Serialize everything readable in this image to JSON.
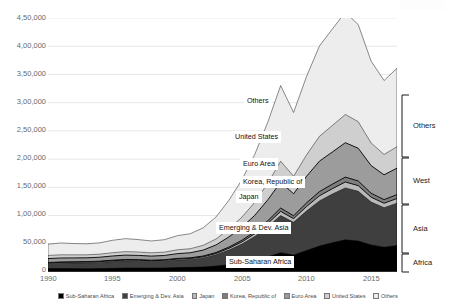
{
  "chart_data": {
    "type": "area",
    "stacked": true,
    "title": "",
    "subtitle": "",
    "xlabel": "",
    "ylabel": "",
    "xlim": [
      1990,
      2017
    ],
    "ylim": [
      0,
      450000
    ],
    "grid": true,
    "grid_axis": "y",
    "legend_position": "bottom",
    "number_format": "indian-grouping",
    "x": [
      1990,
      1991,
      1992,
      1993,
      1994,
      1995,
      1996,
      1997,
      1998,
      1999,
      2000,
      2001,
      2002,
      2003,
      2004,
      2005,
      2006,
      2007,
      2008,
      2009,
      2010,
      2011,
      2012,
      2013,
      2014,
      2015,
      2016,
      2017
    ],
    "xticks": [
      1990,
      1995,
      2000,
      2005,
      2010,
      2015
    ],
    "xtick_labels": [
      "1990",
      "1995",
      "2000",
      "2005",
      "2010",
      "2015"
    ],
    "yticks": [
      0,
      50000,
      100000,
      150000,
      200000,
      250000,
      300000,
      350000,
      400000,
      450000
    ],
    "ytick_labels": [
      "0",
      "50,000",
      "1,00,000",
      "1,50,000",
      "2,00,000",
      "2,50,000",
      "3,00,000",
      "3,50,000",
      "4,00,000",
      "4,50,000"
    ],
    "series": [
      {
        "name": "Sub-Saharan Africa",
        "color": "#000000",
        "values": [
          6000,
          6200,
          6000,
          5800,
          6000,
          6500,
          7000,
          7200,
          7000,
          7200,
          7800,
          8200,
          9000,
          10500,
          13000,
          16500,
          21000,
          27000,
          34000,
          30000,
          38000,
          46000,
          52000,
          57000,
          55000,
          48000,
          44000,
          47000
        ]
      },
      {
        "name": "Emerging & Dev. Asia",
        "color": "#3f3f3f",
        "values": [
          9000,
          9500,
          10000,
          10500,
          11000,
          12000,
          12500,
          12000,
          11500,
          12000,
          13500,
          14000,
          16000,
          20000,
          26000,
          33000,
          42000,
          53000,
          66000,
          58000,
          70000,
          80000,
          86000,
          92000,
          88000,
          76000,
          70000,
          75000
        ]
      },
      {
        "name": "Japan",
        "color": "#b9b9b9",
        "values": [
          1200,
          1300,
          1300,
          1300,
          1400,
          1500,
          1600,
          1600,
          1500,
          1500,
          1600,
          1700,
          1900,
          2300,
          3000,
          3800,
          4800,
          6000,
          7400,
          6500,
          8000,
          9000,
          9600,
          10500,
          10000,
          8500,
          7800,
          8200
        ]
      },
      {
        "name": "Korea, Republic of",
        "color": "#7d7d7d",
        "values": [
          600,
          650,
          700,
          750,
          800,
          900,
          1000,
          1000,
          900,
          950,
          1100,
          1200,
          1400,
          1700,
          2200,
          2900,
          3700,
          4700,
          5900,
          5100,
          6400,
          7400,
          8000,
          8600,
          8300,
          7000,
          6400,
          6800
        ]
      },
      {
        "name": "Euro Area",
        "color": "#9c9c9c",
        "values": [
          7000,
          7200,
          7000,
          6800,
          7000,
          7500,
          7800,
          7600,
          7300,
          7600,
          8500,
          9000,
          10500,
          13500,
          18000,
          23000,
          29000,
          37000,
          46000,
          39000,
          47000,
          54000,
          57000,
          61000,
          58000,
          49000,
          44000,
          47000
        ]
      },
      {
        "name": "United States",
        "color": "#cfcfcf",
        "values": [
          5500,
          5600,
          5400,
          5300,
          5500,
          5800,
          6200,
          6000,
          5800,
          6000,
          6800,
          7200,
          8400,
          10500,
          14000,
          18000,
          23000,
          29500,
          37000,
          31000,
          38000,
          44000,
          47000,
          50000,
          47000,
          40000,
          36000,
          38000
        ]
      },
      {
        "name": "Others",
        "color": "#ededed",
        "values": [
          20000,
          21000,
          20000,
          19500,
          20000,
          22000,
          23000,
          22000,
          21000,
          22000,
          25000,
          26500,
          31000,
          39000,
          51000,
          66000,
          85000,
          108000,
          134000,
          113000,
          139000,
          160000,
          171000,
          181000,
          172000,
          145000,
          131000,
          139000
        ]
      }
    ],
    "series_callouts": [
      {
        "label": "Others",
        "series": "Others"
      },
      {
        "label": "United States",
        "series": "United States"
      },
      {
        "label": "Euro Area",
        "series": "Euro Area"
      },
      {
        "label": "Korea, Republic of",
        "series": "Korea, Republic of"
      },
      {
        "label": "Japan",
        "series": "Japan"
      },
      {
        "label": "Emerging & Dev. Asia",
        "series": "Emerging & Dev. Asia"
      },
      {
        "label": "Sub-Saharan Africa",
        "series": "Sub-Saharan Africa"
      }
    ],
    "group_brackets": [
      {
        "label": "Others",
        "members": [
          "Others"
        ]
      },
      {
        "label": "West",
        "members": [
          "United States",
          "Euro Area"
        ]
      },
      {
        "label": "Asia",
        "members": [
          "Korea, Republic of",
          "Japan",
          "Emerging & Dev. Asia"
        ]
      },
      {
        "label": "Africa",
        "members": [
          "Sub-Saharan Africa"
        ]
      }
    ]
  },
  "axis": {
    "y_labels": [
      "4,50,000",
      "4,00,000",
      "3,50,000",
      "3,00,000",
      "2,50,000",
      "2,00,000",
      "1,50,000",
      "1,00,000",
      "50,000",
      "0"
    ],
    "x_labels": [
      "1990",
      "1995",
      "2000",
      "2005",
      "2010",
      "2015"
    ]
  },
  "callouts": {
    "others": "Others",
    "united_states": "United States",
    "euro_area": "Euro Area",
    "korea": "Korea, Republic of",
    "japan": "Japan",
    "emerging_asia": "Emerging & Dev. Asia",
    "sub_saharan_africa": "Sub-Saharan Africa"
  },
  "brackets": {
    "others": "Others",
    "west": "West",
    "asia": "Asia",
    "africa": "Africa"
  },
  "legend": {
    "items": [
      {
        "label": "Sub-Saharan Africa",
        "color": "#000000"
      },
      {
        "label": "Emerging & Dev. Asia",
        "color": "#3f3f3f"
      },
      {
        "label": "Japan",
        "color": "#b9b9b9"
      },
      {
        "label": "Korea, Republic of",
        "color": "#7d7d7d"
      },
      {
        "label": "Euro Area",
        "color": "#9c9c9c"
      },
      {
        "label": "United States",
        "color": "#cfcfcf"
      },
      {
        "label": "Others",
        "color": "#ededed"
      }
    ]
  }
}
